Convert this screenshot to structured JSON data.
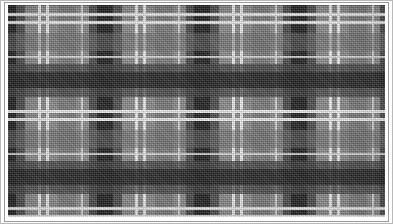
{
  "image": {
    "title": "Tartan Fabric Swatch",
    "kind": "natural-image",
    "width": 393,
    "height": 224,
    "description": "Close-up photograph of a grayscale checked tartan / plaid woven cloth"
  },
  "frame": {
    "background_color": "#fdfdfd",
    "outer_border_color": "#b9b9b9",
    "inner_border_color": "#9a9a9a",
    "cloth_left": 8,
    "cloth_top": 5,
    "cloth_width": 377,
    "cloth_height": 212
  },
  "palette": {
    "ground_gray": "#8d8d8d",
    "mid_gray": "#7b7b7b",
    "dark_gray": "#4a4a4a",
    "darker_gray": "#343434",
    "black_band": "#1f1f1f",
    "white_pinstripe": "#f2f2f2",
    "light_pinstripe": "#dcdcdc"
  },
  "sett": {
    "horizontal_period": 97,
    "vertical_period": 97,
    "warp_origin": -18,
    "weft_origin": -40,
    "repeats_horizontal": 5,
    "repeats_vertical": 3
  },
  "warp_stripes": [
    {
      "name": "black-bar",
      "offset": 10,
      "width": 16,
      "color": "#1f1f1f",
      "alpha": 1.0
    },
    {
      "name": "dark-shadow-left",
      "offset": 2,
      "width": 8,
      "color": "#3d3d3d",
      "alpha": 0.85
    },
    {
      "name": "dark-shadow-right",
      "offset": 26,
      "width": 9,
      "color": "#3d3d3d",
      "alpha": 0.8
    },
    {
      "name": "white-pin-a",
      "offset": 48,
      "width": 3,
      "color": "#f2f2f2",
      "alpha": 1.0
    },
    {
      "name": "white-pin-b",
      "offset": 56,
      "width": 3,
      "color": "#f2f2f2",
      "alpha": 1.0
    },
    {
      "name": "mid-block",
      "offset": 68,
      "width": 18,
      "color": "#6d6d6d",
      "alpha": 0.55
    },
    {
      "name": "white-pin-c",
      "offset": 91,
      "width": 2,
      "color": "#e2e2e2",
      "alpha": 0.9
    }
  ],
  "weft_stripes": [
    {
      "name": "black-bar",
      "offset": 10,
      "width": 16,
      "color": "#1f1f1f",
      "alpha": 1.0
    },
    {
      "name": "dark-shadow-top",
      "offset": 2,
      "width": 8,
      "color": "#3d3d3d",
      "alpha": 0.85
    },
    {
      "name": "dark-shadow-bot",
      "offset": 26,
      "width": 9,
      "color": "#3d3d3d",
      "alpha": 0.8
    },
    {
      "name": "white-pin-a",
      "offset": 48,
      "width": 3,
      "color": "#f2f2f2",
      "alpha": 1.0
    },
    {
      "name": "white-pin-b",
      "offset": 56,
      "width": 3,
      "color": "#f2f2f2",
      "alpha": 1.0
    },
    {
      "name": "mid-block",
      "offset": 68,
      "width": 18,
      "color": "#6d6d6d",
      "alpha": 0.55
    },
    {
      "name": "white-pin-c",
      "offset": 91,
      "width": 2,
      "color": "#e2e2e2",
      "alpha": 0.9
    }
  ]
}
